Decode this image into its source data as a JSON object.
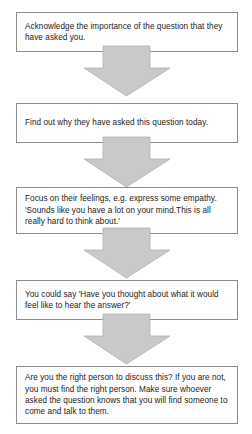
{
  "diagram": {
    "orientation": "vertical",
    "box_fill": "#ffffff",
    "box_border": "#8c8c8c",
    "arrow_fill": "#c9c9c9",
    "text_color": "#1a1a1a",
    "steps": [
      {
        "id": "step-1",
        "text": "Acknowledge the importance of the question that they have asked you."
      },
      {
        "id": "step-2",
        "text": "Find out why they have asked this question today."
      },
      {
        "id": "step-3",
        "text": "Focus on their feelings, e.g. express some empathy. 'Sounds like you have a lot on your mind.This is all really hard to think about.'"
      },
      {
        "id": "step-4",
        "text": "You could say 'Have you thought about what it would feel like to hear the answer?'"
      },
      {
        "id": "step-5",
        "text": "Are you the right person to discuss this? If you are not, you must find the right person. Make sure whoever asked the question knows that you will find someone to come and talk to them."
      }
    ],
    "connectors": [
      {
        "id": "connector-1",
        "from": "step-1",
        "to": "step-2",
        "shape": "down-arrow"
      },
      {
        "id": "connector-2",
        "from": "step-2",
        "to": "step-3",
        "shape": "down-arrow"
      },
      {
        "id": "connector-3",
        "from": "step-3",
        "to": "step-4",
        "shape": "down-arrow"
      },
      {
        "id": "connector-4",
        "from": "step-4",
        "to": "step-5",
        "shape": "down-arrow"
      }
    ]
  }
}
